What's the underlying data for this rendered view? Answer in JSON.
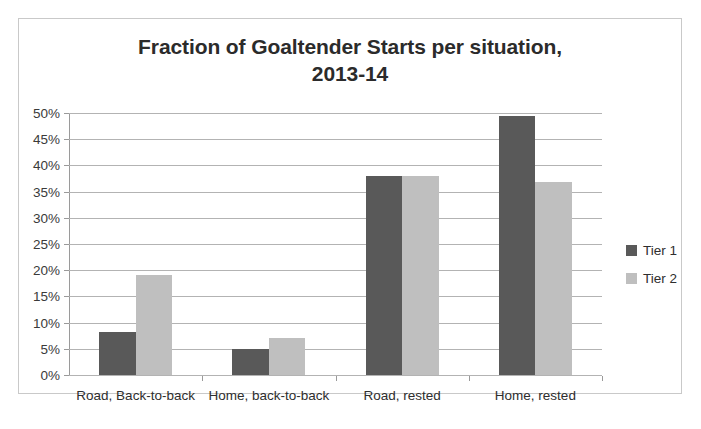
{
  "chart_data": {
    "type": "bar",
    "title": "Fraction of Goaltender Starts per situation, 2013-14",
    "title_line1": "Fraction of Goaltender Starts per situation,",
    "title_line2": "2013-14",
    "xlabel": "",
    "ylabel": "",
    "categories": [
      "Road, Back-to-back",
      "Home, back-to-back",
      "Road, rested",
      "Home, rested"
    ],
    "series": [
      {
        "name": "Tier 1",
        "color": "#595959",
        "values": [
          8.2,
          4.9,
          38.0,
          49.5
        ]
      },
      {
        "name": "Tier 2",
        "color": "#bfbfbf",
        "values": [
          19.0,
          7.0,
          37.9,
          36.8
        ]
      }
    ],
    "ylim": [
      0,
      50
    ],
    "ytick_values": [
      50,
      45,
      40,
      35,
      30,
      25,
      20,
      15,
      10,
      5,
      0
    ],
    "ytick_labels": [
      "50%",
      "45%",
      "40%",
      "35%",
      "30%",
      "25%",
      "20%",
      "15%",
      "10%",
      "5%",
      "0%"
    ],
    "grid": true,
    "grid_axis": "y",
    "legend_position": "right",
    "value_format": "percent",
    "colors": {
      "tier1": "#595959",
      "tier2": "#bfbfbf",
      "gridline": "#b3b3b3",
      "axis": "#9a9a9a",
      "frame_border": "#c9c9c9",
      "title_text": "#2b2b2b",
      "background": "#ffffff"
    }
  }
}
